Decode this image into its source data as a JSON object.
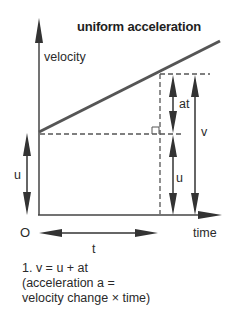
{
  "diagram": {
    "title": "uniform acceleration",
    "y_axis_label": "velocity",
    "x_axis_label": "time",
    "origin_label": "O",
    "labels": {
      "time_interval": "t",
      "velocity_change": "at",
      "initial_velocity_left": "u",
      "initial_velocity_right": "u",
      "final_velocity": "v"
    },
    "caption": {
      "line1": "1. v = u + at",
      "line2": "(acceleration a =",
      "line3": "velocity change × time)"
    },
    "colors": {
      "ink": "#2a2a2a",
      "line": "#555555",
      "background": "#ffffff"
    }
  }
}
